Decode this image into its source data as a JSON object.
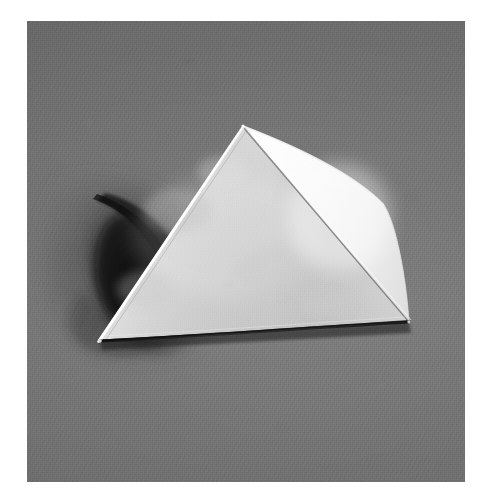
{
  "image": {
    "kind": "photograph",
    "subject": "paper-pyramid-model",
    "description": "Black and white photograph of a folded white paper square pyramid resting on a grey paper backdrop, lit from the upper right so the right face is bright and a dark crescent shadow falls to the left.",
    "width": 487,
    "height": 498,
    "border_color": "#ffffff",
    "print": {
      "left": 27,
      "top": 21,
      "width": 438,
      "height": 461
    }
  },
  "palette": {
    "page_background": "#ffffff",
    "backdrop_grey": "#727272",
    "backdrop_grey_dark": "#6b6b6b",
    "backdrop_grey_light": "#787878",
    "shadow_core": "#1b1b1b",
    "shadow_soft": "#3a3a3a",
    "face_front_light": "#dcdcdc",
    "face_front_dark": "#c2c2c2",
    "face_right_light": "#fbfbfb",
    "face_right_dark": "#e8e8e8",
    "edge_highlight": "#ffffff",
    "edge_ridge": "#9a9a9a",
    "base_line": "#242424"
  },
  "geometry": {
    "note": "coordinates are in the 487x498 screenshot space",
    "apex": {
      "x": 243,
      "y": 126
    },
    "left_base_corner": {
      "x": 100,
      "y": 340
    },
    "right_base_corner": {
      "x": 409,
      "y": 322
    },
    "right_side_corner": {
      "x": 384,
      "y": 205
    },
    "front_face": "apex -> left_base_corner -> right_base_corner",
    "right_face": "apex -> right_side_corner -> right_base_corner",
    "ridge_line": "apex -> right_base_corner",
    "shadow_extent": {
      "x": 62,
      "y": 196,
      "width": 185,
      "height": 158
    }
  },
  "lighting": {
    "key_light_direction": "upper-right",
    "cast_shadow_direction": "left",
    "brightest_surface": "right-face",
    "darkest_region": "cast-shadow-core"
  },
  "annotations": {
    "title": "",
    "caption": "",
    "labels": []
  }
}
